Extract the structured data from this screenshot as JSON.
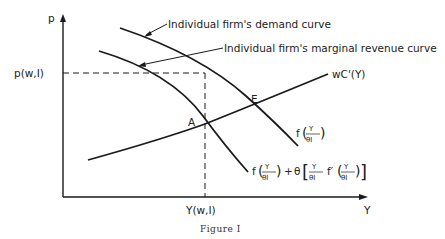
{
  "axes": {
    "y_label": "p",
    "x_label": "Y",
    "y_tick": "p(w,I)",
    "x_tick": "Y(w,I)"
  },
  "annotations": {
    "demand_curve": "Individual firm's demand curve",
    "mr_curve": "Individual firm's marginal revenue curve",
    "cost_curve": "wC'(Y)",
    "point_a": "A",
    "point_e": "E"
  },
  "formulas": {
    "demand": {
      "f": "f",
      "num": "Y",
      "den": "θI"
    },
    "mr": {
      "f": "f",
      "num": "Y",
      "den": "θI",
      "plus": "+",
      "theta": "θ",
      "fprime": "f′"
    }
  },
  "caption": "Figure I"
}
